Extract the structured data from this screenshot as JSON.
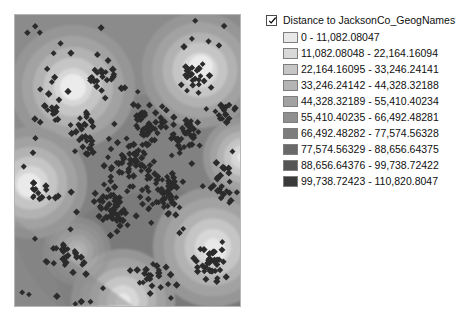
{
  "clipped_text": "......  ...",
  "map": {
    "name": "distance-raster-map",
    "alt": "Euclidean distance raster with point features"
  },
  "legend": {
    "checkbox_checked": true,
    "title": "Distance to JacksonCo_GeogNames",
    "classes": [
      {
        "label": "0 - 11,082.08047",
        "color": "#e8e8e8"
      },
      {
        "label": "11,082.08048 - 22,164.16094",
        "color": "#d8d8d8"
      },
      {
        "label": "22,164.16095 - 33,246.24141",
        "color": "#c6c6c6"
      },
      {
        "label": "33,246.24142 - 44,328.32188",
        "color": "#b4b4b4"
      },
      {
        "label": "44,328.32189 - 55,410.40234",
        "color": "#a2a2a2"
      },
      {
        "label": "55,410.40235 - 66,492.48281",
        "color": "#8f8f8f"
      },
      {
        "label": "66,492.48282 - 77,574.56328",
        "color": "#7d7d7d"
      },
      {
        "label": "77,574.56329 - 88,656.64375",
        "color": "#696969"
      },
      {
        "label": "88,656.64376 - 99,738.72422",
        "color": "#545454"
      },
      {
        "label": "99,738.72423 - 110,820.8047",
        "color": "#3a3a3a"
      }
    ]
  }
}
